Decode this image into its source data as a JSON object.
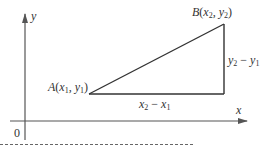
{
  "diagram": {
    "type": "coordinate-geometry",
    "colors": {
      "axis": "#555555",
      "triangle": "#333333",
      "text": "#333333",
      "dashed_rule": "#666666"
    },
    "axes": {
      "x_label": "x",
      "y_label": "y",
      "origin_label": "0"
    },
    "points": {
      "A": {
        "name": "A",
        "open": "(",
        "x": "x",
        "x_sub": "1",
        "sep": ", ",
        "y": "y",
        "y_sub": "1",
        "close": ")"
      },
      "B": {
        "name": "B",
        "open": "(",
        "x": "x",
        "x_sub": "2",
        "sep": ", ",
        "y": "y",
        "y_sub": "2",
        "close": ")"
      }
    },
    "segments": {
      "horizontal": {
        "a": "x",
        "a_sub": "2",
        "op": " − ",
        "b": "x",
        "b_sub": "1"
      },
      "vertical": {
        "a": "y",
        "a_sub": "2",
        "op": " − ",
        "b": "y",
        "b_sub": "1"
      }
    }
  }
}
